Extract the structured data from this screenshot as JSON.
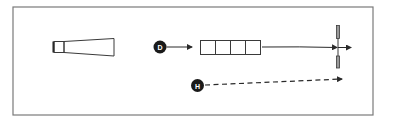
{
  "diagram": {
    "type": "schematic",
    "colors": {
      "frame": "#7a7a7a",
      "stroke": "#3a3a3a",
      "node_fill": "#1a1a1a",
      "node_text": "#ffffff",
      "rod_fill": "#9a9a9a"
    },
    "nodes": [
      {
        "id": "D",
        "label": "D"
      },
      {
        "id": "H",
        "label": "H"
      }
    ],
    "components": {
      "cone": {
        "name": "tapered-cone"
      },
      "segmented_box": {
        "name": "segmented-box",
        "cell_count": 4
      },
      "cross_rod": {
        "name": "vertical-rod-crosshair"
      }
    },
    "connections": [
      {
        "from": "D",
        "to": "segmented-box",
        "style": "solid",
        "arrow": true
      },
      {
        "from": "segmented-box",
        "to": "crosshair",
        "style": "solid",
        "arrow": true
      },
      {
        "from": "H",
        "to": "crosshair-region",
        "style": "dashed",
        "arrow": true
      }
    ]
  }
}
